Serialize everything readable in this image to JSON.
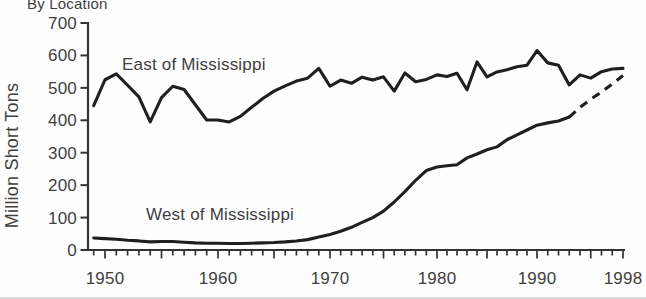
{
  "figure": {
    "title": "By Location"
  },
  "colors": {
    "line": "#1f1f1f",
    "axis": "#333333",
    "text": "#3f3f3f",
    "background": "#fefefe"
  },
  "chart_data": {
    "type": "line",
    "title": "By Location",
    "xlabel": "",
    "ylabel": "Million Short Tons",
    "ylim": [
      0,
      700
    ],
    "y_ticks": [
      0,
      100,
      200,
      300,
      400,
      500,
      600,
      700
    ],
    "x_tick_labels": [
      1950,
      1960,
      1970,
      1980,
      1990,
      1998
    ],
    "grid": false,
    "legend": "inline annotations on lines",
    "units": "million short tons",
    "x": [
      1949,
      1950,
      1951,
      1952,
      1953,
      1954,
      1955,
      1956,
      1957,
      1958,
      1959,
      1960,
      1961,
      1962,
      1963,
      1964,
      1965,
      1966,
      1967,
      1968,
      1969,
      1970,
      1971,
      1972,
      1973,
      1974,
      1975,
      1976,
      1977,
      1978,
      1979,
      1980,
      1981,
      1982,
      1983,
      1984,
      1985,
      1986,
      1987,
      1988,
      1989,
      1990,
      1991,
      1992,
      1993,
      1994,
      1995,
      1996,
      1997,
      1998
    ],
    "series": [
      {
        "name": "East of Mississippi",
        "style": "solid",
        "values": [
          445,
          525,
          543,
          508,
          472,
          395,
          470,
          505,
          495,
          448,
          401,
          401,
          395,
          412,
          440,
          467,
          490,
          506,
          521,
          530,
          560,
          505,
          524,
          514,
          533,
          524,
          534,
          490,
          546,
          519,
          526,
          540,
          535,
          545,
          494,
          580,
          534,
          549,
          556,
          565,
          570,
          615,
          577,
          570,
          509,
          540,
          530,
          550,
          558,
          560
        ]
      },
      {
        "name": "West of Mississippi",
        "style": "solid, dashed after 1993 (projection)",
        "dashed_from_year": 1993,
        "values": [
          37,
          35,
          33,
          30,
          28,
          25,
          26,
          26,
          24,
          22,
          21,
          21,
          20,
          20,
          21,
          22,
          23,
          25,
          28,
          32,
          40,
          48,
          58,
          70,
          85,
          100,
          120,
          148,
          180,
          215,
          245,
          256,
          260,
          263,
          284,
          296,
          309,
          318,
          340,
          355,
          370,
          385,
          392,
          398,
          410,
          440,
          465,
          487,
          512,
          538
        ]
      }
    ],
    "annotations": [
      {
        "text": "East of Mississippi",
        "year": 1951.5,
        "value": 570
      },
      {
        "text": "West of Mississippi",
        "year": 1953.6,
        "value": 108
      }
    ]
  }
}
